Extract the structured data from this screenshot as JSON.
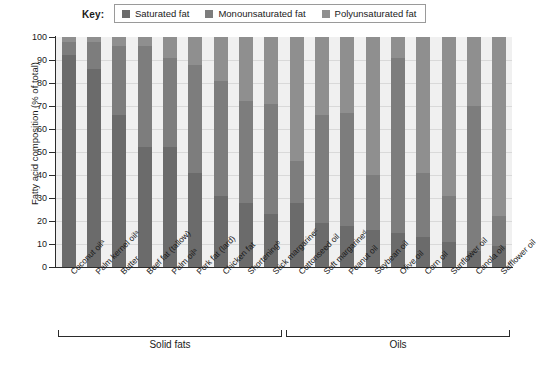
{
  "legend": {
    "title": "Key:",
    "items": [
      {
        "label": "Saturated fat",
        "color": "#6b6b6b",
        "swatch_name": "legend-swatch-saturated"
      },
      {
        "label": "Monounsaturated fat",
        "color": "#7d7d7d",
        "swatch_name": "legend-swatch-monounsaturated"
      },
      {
        "label": "Polyunsaturated fat",
        "color": "#8f8f8f",
        "swatch_name": "legend-swatch-polyunsaturated"
      }
    ]
  },
  "axes": {
    "y_title": "Fatty acid composition (% of total)",
    "y_ticks": [
      "0",
      "10",
      "20",
      "30",
      "40",
      "50",
      "60",
      "70",
      "80",
      "90",
      "100"
    ]
  },
  "groups": [
    {
      "label": "Solid fats"
    },
    {
      "label": "Oils"
    }
  ],
  "chart_data": {
    "type": "bar",
    "xlabel": "",
    "ylabel": "Fatty acid composition (% of total)",
    "ylim": [
      0,
      100
    ],
    "grid": true,
    "stacked": true,
    "stacked_to_100": true,
    "legend_position": "top",
    "legend_entries": [
      "Saturated fat",
      "Monounsaturated fat",
      "Polyunsaturated fat"
    ],
    "categories": [
      "Coconut oilᵃ",
      "Palm kernel oilᵃ",
      "Butter",
      "Beef fat (tallow)",
      "Palm oilᵃ",
      "Pork fat (lard)",
      "Chicken fat",
      "Shorteningᵇ",
      "Stick margarineᶜ",
      "Cottonseed oil",
      "Soft margarineᵈ",
      "Peanut oil",
      "Soybean oil",
      "Olive oil",
      "Corn oil",
      "Sunflower oil",
      "Canola oil",
      "Safflower oil"
    ],
    "category_groups": [
      "Solid fats",
      "Solid fats",
      "Solid fats",
      "Solid fats",
      "Solid fats",
      "Solid fats",
      "Solid fats",
      "Solid fats",
      "Solid fats",
      "Oils",
      "Oils",
      "Oils",
      "Oils",
      "Oils",
      "Oils",
      "Oils",
      "Oils",
      "Oils"
    ],
    "series": [
      {
        "name": "Saturated fat",
        "color": "#6b6b6b",
        "values": [
          92,
          86,
          66,
          52,
          52,
          41,
          31,
          28,
          23,
          28,
          19,
          18,
          16,
          15,
          13,
          11,
          7,
          9
        ]
      },
      {
        "name": "Monounsaturated fat",
        "color": "#7d7d7d",
        "values": [
          6,
          12,
          30,
          44,
          39,
          47,
          50,
          44,
          48,
          18,
          47,
          49,
          24,
          76,
          28,
          20,
          63,
          13
        ]
      },
      {
        "name": "Polyunsaturated fat",
        "color": "#8f8f8f",
        "values": [
          2,
          2,
          4,
          4,
          9,
          12,
          19,
          28,
          29,
          54,
          34,
          33,
          60,
          9,
          59,
          69,
          30,
          78
        ]
      }
    ]
  }
}
